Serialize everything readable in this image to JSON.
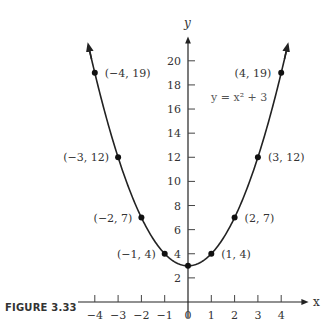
{
  "caption": "FIGURE 3.33",
  "chart_data": {
    "type": "line",
    "title": "",
    "equation_label": "y = x² + 3",
    "xlabel": "x",
    "ylabel": "y",
    "xlim": [
      -4,
      4
    ],
    "ylim": [
      0,
      21
    ],
    "x_ticks": [
      "-4",
      "-3",
      "-2",
      "-1",
      "0",
      "1",
      "2",
      "3",
      "4"
    ],
    "y_ticks": [
      "2",
      "4",
      "6",
      "8",
      "10",
      "12",
      "14",
      "16",
      "18",
      "20"
    ],
    "grid": false,
    "legend": "none",
    "series": [
      {
        "name": "y = x² + 3",
        "x": [
          -4,
          -3,
          -2,
          -1,
          0,
          1,
          2,
          3,
          4
        ],
        "y": [
          19,
          12,
          7,
          4,
          3,
          4,
          7,
          12,
          19
        ]
      }
    ],
    "point_labels": [
      {
        "x": -4,
        "y": 19,
        "label": "(−4, 19)"
      },
      {
        "x": -3,
        "y": 12,
        "label": "(−3, 12)"
      },
      {
        "x": -2,
        "y": 7,
        "label": "(−2, 7)"
      },
      {
        "x": -1,
        "y": 4,
        "label": "(−1, 4)"
      },
      {
        "x": 1,
        "y": 4,
        "label": "(1, 4)"
      },
      {
        "x": 2,
        "y": 7,
        "label": "(2, 7)"
      },
      {
        "x": 3,
        "y": 12,
        "label": "(3, 12)"
      },
      {
        "x": 4,
        "y": 19,
        "label": "(4, 19)"
      }
    ]
  }
}
